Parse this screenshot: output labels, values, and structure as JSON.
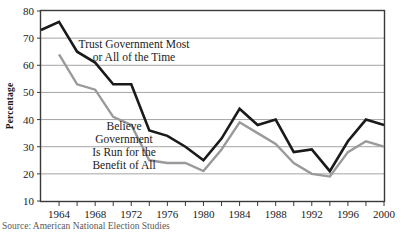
{
  "chart_data": {
    "type": "line",
    "title": "",
    "xlabel": "",
    "ylabel": "Percentage",
    "xlim": [
      1962,
      2000
    ],
    "ylim": [
      10,
      80
    ],
    "ytick_values": [
      10,
      20,
      30,
      40,
      50,
      60,
      70,
      80
    ],
    "ytick_labels": [
      "10",
      "20",
      "30",
      "40",
      "50",
      "60",
      "70",
      "80"
    ],
    "xtick_values": [
      1962,
      1964,
      1966,
      1968,
      1970,
      1972,
      1974,
      1976,
      1978,
      1980,
      1982,
      1984,
      1986,
      1988,
      1990,
      1992,
      1994,
      1996,
      1998,
      2000
    ],
    "xtick_labels": [
      "",
      "1964",
      "",
      "1968",
      "",
      "1972",
      "",
      "1976",
      "",
      "1980",
      "",
      "1984",
      "",
      "1988",
      "",
      "1992",
      "",
      "1996",
      "",
      "2000"
    ],
    "grid": "horizontal",
    "legend_position": "inline-annotations",
    "series": [
      {
        "name": "Trust Government Most or All of the Time",
        "label_lines": [
          "Trust Government Most",
          "or All of the Time"
        ],
        "color": "#1a1a1a",
        "x": [
          1962,
          1964,
          1966,
          1968,
          1970,
          1972,
          1974,
          1976,
          1978,
          1980,
          1982,
          1984,
          1986,
          1988,
          1990,
          1992,
          1994,
          1996,
          1998,
          2000
        ],
        "values": [
          73,
          76,
          65,
          61,
          53,
          53,
          36,
          34,
          30,
          25,
          33,
          44,
          38,
          40,
          28,
          29,
          21,
          32,
          40,
          38
        ]
      },
      {
        "name": "Believe Government Is Run for the Benefit of All",
        "label_lines": [
          "Believe",
          "Government",
          "Is Run for the",
          "Benefit of All"
        ],
        "color": "#9a9a9a",
        "x": [
          1964,
          1966,
          1968,
          1970,
          1972,
          1974,
          1976,
          1978,
          1980,
          1982,
          1984,
          1986,
          1988,
          1990,
          1992,
          1994,
          1996,
          1998,
          2000
        ],
        "values": [
          64,
          53,
          51,
          41,
          38,
          25,
          24,
          24,
          21,
          29,
          39,
          35,
          31,
          24,
          20,
          19,
          28,
          32,
          30
        ]
      }
    ],
    "annotations": [
      {
        "name": "trust-government-label",
        "lines": [
          "Trust Government Most",
          "or All of the Time"
        ],
        "x": 1972.3,
        "y": 66.5
      },
      {
        "name": "believe-government-label",
        "lines": [
          "Believe",
          "Government",
          "Is Run for the",
          "Benefit of All"
        ],
        "x": 1971.2,
        "y": 36.0
      }
    ]
  },
  "axes": {
    "ylabel": "Percentage"
  },
  "caption": {
    "text": "Source: American National Election Studies"
  }
}
